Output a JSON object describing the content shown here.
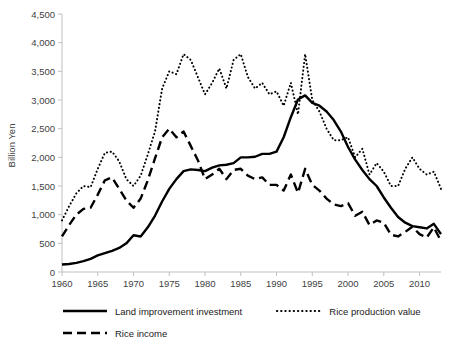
{
  "chart_data": {
    "type": "line",
    "title": "",
    "subtitle": "",
    "xlabel": "",
    "ylabel": "Billion Yen",
    "xlim": [
      1960,
      2013
    ],
    "ylim": [
      0,
      4500
    ],
    "grid": false,
    "legend_position": "bottom",
    "x_ticks": [
      "1960",
      "1965",
      "1970",
      "1975",
      "1980",
      "1985",
      "1990",
      "1995",
      "2000",
      "2005",
      "2010"
    ],
    "y_ticks": [
      "0",
      "500",
      "1,000",
      "1,500",
      "2,000",
      "2,500",
      "3,000",
      "3,500",
      "4,000",
      "4,500"
    ],
    "x": [
      1960,
      1961,
      1962,
      1963,
      1964,
      1965,
      1966,
      1967,
      1968,
      1969,
      1970,
      1971,
      1972,
      1973,
      1974,
      1975,
      1976,
      1977,
      1978,
      1979,
      1980,
      1981,
      1982,
      1983,
      1984,
      1985,
      1986,
      1987,
      1988,
      1989,
      1990,
      1991,
      1992,
      1993,
      1994,
      1995,
      1996,
      1997,
      1998,
      1999,
      2000,
      2001,
      2002,
      2003,
      2004,
      2005,
      2006,
      2007,
      2008,
      2009,
      2010,
      2011,
      2012,
      2013
    ],
    "series": [
      {
        "name": "Land improvement investment",
        "style": "solid",
        "color": "#000000",
        "values": [
          130,
          140,
          160,
          190,
          230,
          290,
          330,
          370,
          420,
          500,
          640,
          620,
          780,
          980,
          1230,
          1450,
          1620,
          1760,
          1790,
          1780,
          1760,
          1820,
          1860,
          1870,
          1900,
          2000,
          2000,
          2010,
          2060,
          2060,
          2100,
          2350,
          2700,
          3010,
          3080,
          2950,
          2900,
          2800,
          2650,
          2450,
          2180,
          1960,
          1780,
          1620,
          1500,
          1300,
          1120,
          960,
          860,
          800,
          780,
          760,
          840,
          660
        ]
      },
      {
        "name": "Rice production value",
        "style": "dotted",
        "color": "#000000",
        "values": [
          900,
          1150,
          1370,
          1500,
          1480,
          1800,
          2080,
          2100,
          1930,
          1620,
          1500,
          1680,
          2050,
          2450,
          3200,
          3500,
          3450,
          3800,
          3700,
          3400,
          3100,
          3300,
          3550,
          3200,
          3700,
          3800,
          3400,
          3200,
          3300,
          3100,
          3150,
          2900,
          3300,
          2750,
          3800,
          3000,
          2800,
          2500,
          2300,
          2300,
          2350,
          2000,
          2150,
          1700,
          1900,
          1750,
          1500,
          1500,
          1800,
          2000,
          1800,
          1700,
          1750,
          1450
        ]
      },
      {
        "name": "Rice income",
        "style": "dashed",
        "color": "#000000",
        "values": [
          620,
          820,
          1000,
          1100,
          1120,
          1350,
          1600,
          1650,
          1450,
          1250,
          1120,
          1280,
          1600,
          1980,
          2350,
          2500,
          2350,
          2450,
          2200,
          1950,
          1620,
          1700,
          1800,
          1620,
          1780,
          1800,
          1680,
          1620,
          1650,
          1520,
          1520,
          1420,
          1700,
          1380,
          1800,
          1520,
          1420,
          1280,
          1180,
          1150,
          1200,
          980,
          1050,
          820,
          900,
          860,
          650,
          620,
          700,
          790,
          660,
          600,
          780,
          540
        ]
      }
    ]
  },
  "legend": [
    {
      "label": "Land improvement investment",
      "style": "solid"
    },
    {
      "label": "Rice production value",
      "style": "dotted"
    },
    {
      "label": "Rice income",
      "style": "dashed"
    }
  ],
  "axis": {
    "y_title": "Billion Yen"
  }
}
